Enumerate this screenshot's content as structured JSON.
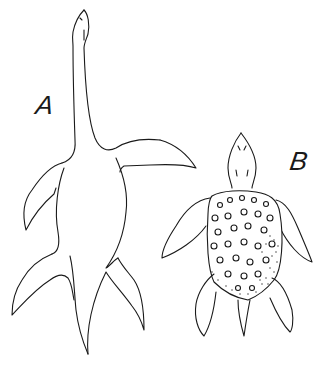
{
  "figure": {
    "labels": {
      "a": "A",
      "b": "B"
    },
    "subjects": [
      {
        "id": "A",
        "name": "plesiosaur",
        "view": "dorsal outline"
      },
      {
        "id": "B",
        "name": "sea turtle",
        "view": "dorsal outline with textured carapace"
      }
    ],
    "colors": {
      "background": "#ffffff",
      "ink": "#1a1a1a"
    }
  }
}
